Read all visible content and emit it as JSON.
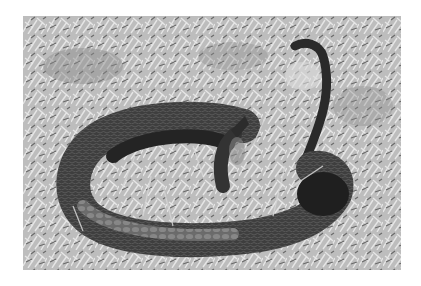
{
  "image": {
    "description": "Grayscale photograph of a coiled snake lying in grass, head raised, tail curling upward",
    "subject": "snake",
    "background": "grass",
    "colors": {
      "page_background": "#ffffff",
      "grass_light": "#d8d8d8",
      "grass_mid": "#a8a8a8",
      "grass_dark": "#5a5a5a",
      "snake_body": "#3a3a3a",
      "snake_dark": "#1e1e1e",
      "snake_belly": "#7a7a7a"
    }
  }
}
